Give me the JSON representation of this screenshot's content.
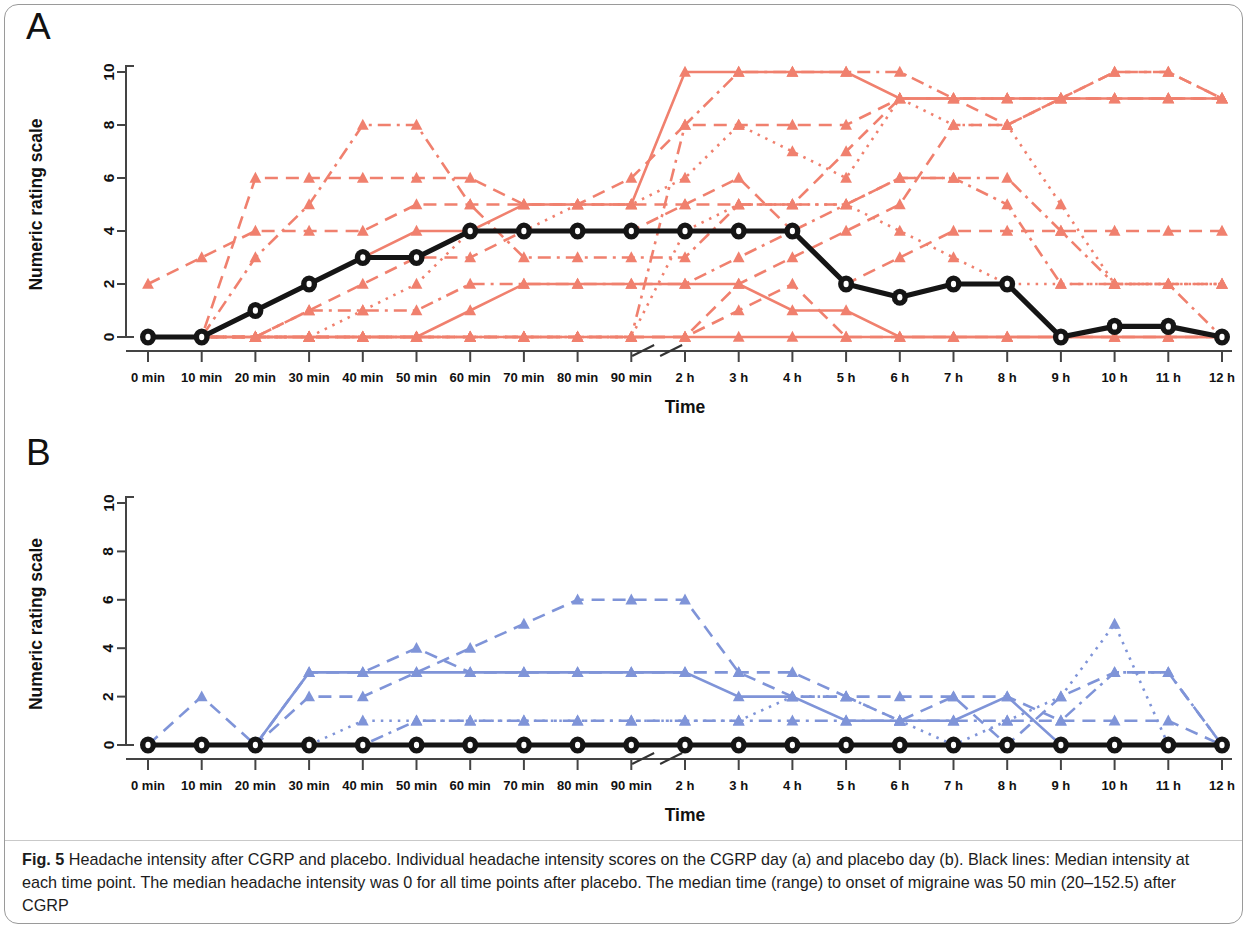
{
  "figure": {
    "panel_a_label": "A",
    "panel_b_label": "B",
    "caption_prefix": "Fig. 5",
    "caption_text": " Headache intensity after CGRP and placebo. Individual headache intensity scores on the CGRP day (a) and placebo day (b). Black lines: Median intensity at each time point. The median headache intensity was 0 for all time points after placebo. The median time (range) to onset of migraine was 50 min (20–152.5) after CGRP",
    "colors": {
      "cgrp_red": "#f0806e",
      "placebo_blue": "#7f94d8",
      "median_black": "#151515",
      "axis_gray": "#444444",
      "frame_gray": "#9a9a9a"
    }
  },
  "chart_data": [
    {
      "type": "line",
      "panel": "A",
      "title": "Headache intensity after CGRP",
      "xlabel": "Time",
      "ylabel": "Numeric rating scale",
      "ylim": [
        0,
        10
      ],
      "yticks": [
        0,
        2,
        4,
        6,
        8,
        10
      ],
      "grid": false,
      "legend_position": "none",
      "axis_break_after": "90 min",
      "categories": [
        "0 min",
        "10 min",
        "20 min",
        "30 min",
        "40 min",
        "50 min",
        "60 min",
        "70 min",
        "80 min",
        "90 min",
        "2 h",
        "3 h",
        "4 h",
        "5 h",
        "6 h",
        "7 h",
        "8 h",
        "9 h",
        "10 h",
        "11 h",
        "12 h"
      ],
      "series": [
        {
          "name": "Median (CGRP)",
          "role": "median",
          "color": "#151515",
          "dash": "solid",
          "values": [
            0,
            0,
            1,
            2,
            3,
            3,
            4,
            4,
            4,
            4,
            4,
            4,
            4,
            2,
            1.5,
            2,
            2,
            0,
            0.4,
            0.4,
            0
          ]
        },
        {
          "name": "Subject 1",
          "role": "individual",
          "color": "#f0806e",
          "dash": "dashed",
          "values": [
            2,
            3,
            4,
            4,
            4,
            5,
            5,
            5,
            5,
            5,
            5,
            5,
            5,
            7,
            9,
            9,
            8,
            9,
            10,
            10,
            9
          ]
        },
        {
          "name": "Subject 2",
          "role": "individual",
          "color": "#f0806e",
          "dash": "dashed",
          "values": [
            0,
            0,
            6,
            6,
            6,
            6,
            6,
            5,
            5,
            6,
            8,
            8,
            8,
            8,
            9,
            9,
            9,
            9,
            9,
            9,
            9
          ]
        },
        {
          "name": "Subject 3",
          "role": "individual",
          "color": "#f0806e",
          "dash": "dashdot",
          "values": [
            0,
            0,
            3,
            5,
            8,
            8,
            5,
            3,
            3,
            3,
            3,
            5,
            5,
            5,
            6,
            6,
            6,
            4,
            2,
            2,
            2
          ]
        },
        {
          "name": "Subject 4",
          "role": "individual",
          "color": "#f0806e",
          "dash": "solid",
          "values": [
            0,
            0,
            1,
            2,
            3,
            4,
            4,
            5,
            5,
            5,
            10,
            10,
            10,
            10,
            9,
            9,
            9,
            9,
            9,
            9,
            9
          ]
        },
        {
          "name": "Subject 5",
          "role": "individual",
          "color": "#f0806e",
          "dash": "dashed",
          "values": [
            0,
            0,
            0,
            1,
            2,
            3,
            3,
            4,
            4,
            4,
            5,
            6,
            4,
            2,
            3,
            4,
            4,
            4,
            4,
            4,
            4
          ]
        },
        {
          "name": "Subject 6",
          "role": "individual",
          "color": "#f0806e",
          "dash": "dotted",
          "values": [
            0,
            0,
            0,
            0,
            1,
            2,
            4,
            4,
            5,
            5,
            6,
            8,
            7,
            6,
            9,
            8,
            8,
            5,
            2,
            2,
            2
          ]
        },
        {
          "name": "Subject 7",
          "role": "individual",
          "color": "#f0806e",
          "dash": "dashdot",
          "values": [
            0,
            0,
            0,
            1,
            1,
            1,
            2,
            2,
            2,
            2,
            2,
            3,
            4,
            5,
            6,
            6,
            5,
            2,
            2,
            2,
            0
          ]
        },
        {
          "name": "Subject 8",
          "role": "individual",
          "color": "#f0806e",
          "dash": "solid",
          "values": [
            0,
            0,
            0,
            0,
            0,
            0,
            1,
            2,
            2,
            2,
            2,
            2,
            1,
            1,
            0,
            0,
            0,
            0,
            0,
            0,
            0
          ]
        },
        {
          "name": "Subject 9",
          "role": "individual",
          "color": "#f0806e",
          "dash": "dashed",
          "values": [
            0,
            0,
            0,
            0,
            0,
            0,
            0,
            0,
            0,
            0,
            0,
            2,
            3,
            4,
            5,
            8,
            8,
            9,
            9,
            9,
            9
          ]
        },
        {
          "name": "Subject 10",
          "role": "individual",
          "color": "#f0806e",
          "dash": "dashdot",
          "values": [
            0,
            0,
            0,
            0,
            0,
            0,
            0,
            0,
            0,
            0,
            8,
            10,
            10,
            10,
            10,
            9,
            9,
            9,
            10,
            10,
            9
          ]
        },
        {
          "name": "Subject 11",
          "role": "individual",
          "color": "#f0806e",
          "dash": "dotted",
          "values": [
            0,
            0,
            0,
            0,
            0,
            0,
            0,
            0,
            0,
            0,
            4,
            5,
            5,
            5,
            4,
            3,
            2,
            2,
            2,
            2,
            2
          ]
        },
        {
          "name": "Subject 12",
          "role": "individual",
          "color": "#f0806e",
          "dash": "dashed",
          "values": [
            0,
            0,
            0,
            0,
            0,
            0,
            0,
            0,
            0,
            0,
            0,
            1,
            2,
            0,
            0,
            0,
            0,
            0,
            0,
            0,
            0
          ]
        },
        {
          "name": "Subject 13",
          "role": "individual",
          "color": "#f0806e",
          "dash": "solid",
          "values": [
            0,
            0,
            0,
            0,
            0,
            0,
            0,
            0,
            0,
            0,
            0,
            0,
            0,
            0,
            0,
            0,
            0,
            0,
            0,
            0,
            0
          ]
        }
      ]
    },
    {
      "type": "line",
      "panel": "B",
      "title": "Headache intensity after placebo",
      "xlabel": "Time",
      "ylabel": "Numeric rating scale",
      "ylim": [
        0,
        10
      ],
      "yticks": [
        0,
        2,
        4,
        6,
        8,
        10
      ],
      "grid": false,
      "legend_position": "none",
      "axis_break_after": "90 min",
      "categories": [
        "0 min",
        "10 min",
        "20 min",
        "30 min",
        "40 min",
        "50 min",
        "60 min",
        "70 min",
        "80 min",
        "90 min",
        "2 h",
        "3 h",
        "4 h",
        "5 h",
        "6 h",
        "7 h",
        "8 h",
        "9 h",
        "10 h",
        "11 h",
        "12 h"
      ],
      "series": [
        {
          "name": "Median (placebo)",
          "role": "median",
          "color": "#151515",
          "dash": "solid",
          "values": [
            0,
            0,
            0,
            0,
            0,
            0,
            0,
            0,
            0,
            0,
            0,
            0,
            0,
            0,
            0,
            0,
            0,
            0,
            0,
            0,
            0
          ]
        },
        {
          "name": "Subject 1",
          "role": "individual",
          "color": "#7f94d8",
          "dash": "dashed",
          "values": [
            0,
            2,
            0,
            3,
            3,
            4,
            3,
            3,
            3,
            3,
            3,
            3,
            3,
            2,
            2,
            2,
            2,
            1,
            1,
            1,
            0
          ]
        },
        {
          "name": "Subject 2",
          "role": "individual",
          "color": "#7f94d8",
          "dash": "dashed",
          "values": [
            0,
            0,
            0,
            2,
            2,
            3,
            4,
            5,
            6,
            6,
            6,
            3,
            2,
            2,
            1,
            2,
            0,
            2,
            3,
            3,
            0
          ]
        },
        {
          "name": "Subject 3",
          "role": "individual",
          "color": "#7f94d8",
          "dash": "dotted",
          "values": [
            0,
            0,
            0,
            0,
            1,
            1,
            1,
            1,
            1,
            1,
            1,
            1,
            2,
            2,
            1,
            0,
            1,
            2,
            5,
            0,
            0
          ]
        },
        {
          "name": "Subject 4",
          "role": "individual",
          "color": "#7f94d8",
          "dash": "solid",
          "values": [
            0,
            0,
            0,
            3,
            3,
            3,
            3,
            3,
            3,
            3,
            3,
            2,
            2,
            1,
            1,
            1,
            2,
            0,
            0,
            0,
            0
          ]
        },
        {
          "name": "Subject 5",
          "role": "individual",
          "color": "#7f94d8",
          "dash": "dashdot",
          "values": [
            0,
            0,
            0,
            0,
            0,
            1,
            1,
            1,
            1,
            1,
            1,
            1,
            1,
            1,
            1,
            1,
            1,
            1,
            3,
            3,
            0
          ]
        },
        {
          "name": "Subject 6",
          "role": "individual",
          "color": "#7f94d8",
          "dash": "solid",
          "values": [
            0,
            0,
            0,
            0,
            0,
            0,
            0,
            0,
            0,
            0,
            0,
            0,
            0,
            0,
            0,
            0,
            0,
            0,
            0,
            0,
            0
          ]
        }
      ]
    }
  ]
}
